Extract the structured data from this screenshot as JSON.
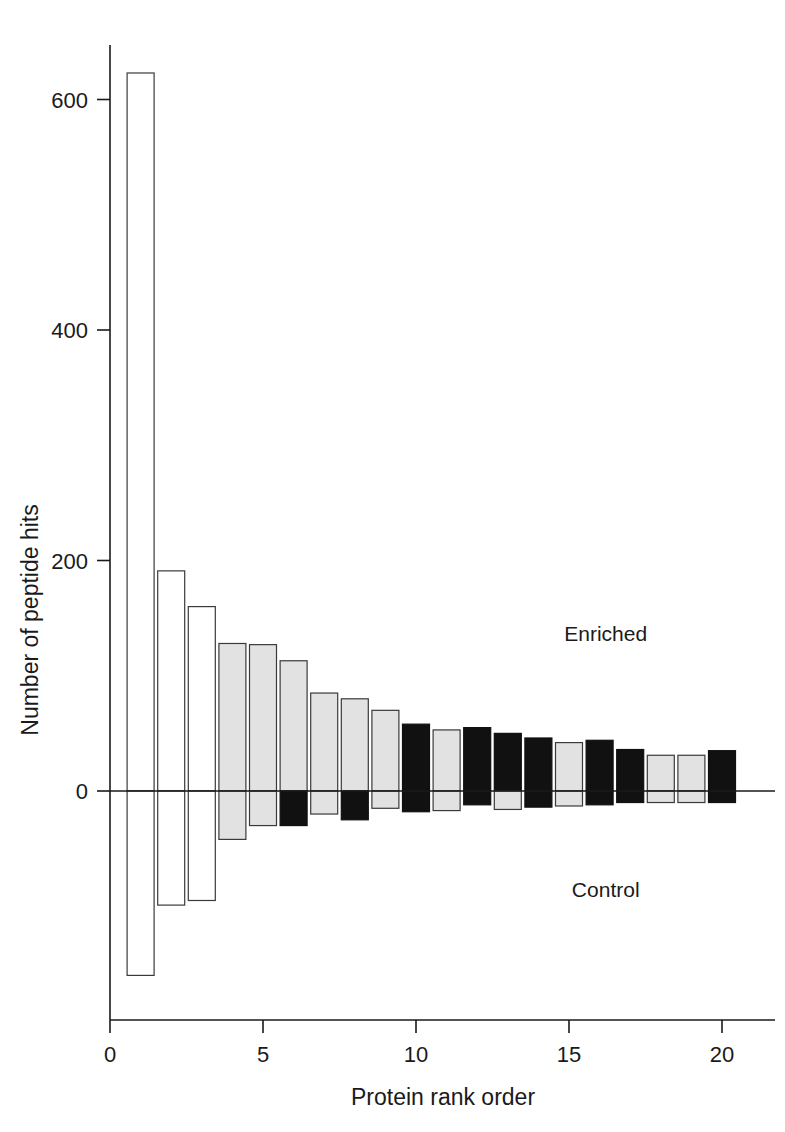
{
  "chart_data": {
    "type": "bar",
    "title": "",
    "xlabel": "Protein rank order",
    "ylabel": "Number of peptide hits",
    "xlim": [
      0,
      21
    ],
    "ylim": [
      -200,
      660
    ],
    "grid": false,
    "legend": "none",
    "annotations": [
      {
        "text": "Enriched",
        "x": 16.2,
        "y": 130
      },
      {
        "text": "Control",
        "x": 16.2,
        "y": -92
      }
    ],
    "xticks": [
      0,
      5,
      10,
      15,
      20
    ],
    "xtick_labels": [
      "0",
      "5",
      "10",
      "15",
      "20"
    ],
    "yticks": [
      0,
      200,
      400,
      600
    ],
    "ytick_labels": [
      "0",
      "200",
      "400",
      "600"
    ],
    "categories": [
      1,
      2,
      3,
      4,
      5,
      6,
      7,
      8,
      9,
      10,
      11,
      12,
      13,
      14,
      15,
      16,
      17,
      18,
      19,
      20
    ],
    "series": [
      {
        "name": "Enriched",
        "values": [
          623,
          191,
          160,
          128,
          127,
          113,
          85,
          80,
          70,
          58,
          53,
          55,
          50,
          46,
          42,
          44,
          36,
          31,
          31,
          35
        ]
      },
      {
        "name": "Control",
        "values": [
          -160,
          -99,
          -95,
          -42,
          -30,
          -30,
          -20,
          -25,
          -15,
          -18,
          -17,
          -12,
          -16,
          -14,
          -13,
          -12,
          -10,
          -10,
          -10,
          -10
        ]
      }
    ],
    "bar_fills": [
      "white",
      "white",
      "white",
      "gray",
      "gray",
      "mixed-gray-black",
      "gray",
      "mixed-gray-black",
      "gray",
      "black",
      "gray",
      "black",
      "black",
      "black",
      "gray",
      "black",
      "black",
      "gray",
      "gray",
      "black"
    ],
    "bar_styles": [
      {
        "rank": 1,
        "top_fill": "white",
        "bottom_fill": "white"
      },
      {
        "rank": 2,
        "top_fill": "white",
        "bottom_fill": "white"
      },
      {
        "rank": 3,
        "top_fill": "white",
        "bottom_fill": "white"
      },
      {
        "rank": 4,
        "top_fill": "gray",
        "bottom_fill": "gray"
      },
      {
        "rank": 5,
        "top_fill": "gray",
        "bottom_fill": "gray"
      },
      {
        "rank": 6,
        "top_fill": "gray",
        "bottom_fill": "black"
      },
      {
        "rank": 7,
        "top_fill": "gray",
        "bottom_fill": "gray"
      },
      {
        "rank": 8,
        "top_fill": "gray",
        "bottom_fill": "black"
      },
      {
        "rank": 9,
        "top_fill": "gray",
        "bottom_fill": "gray"
      },
      {
        "rank": 10,
        "top_fill": "black",
        "bottom_fill": "black"
      },
      {
        "rank": 11,
        "top_fill": "gray",
        "bottom_fill": "gray"
      },
      {
        "rank": 12,
        "top_fill": "black",
        "bottom_fill": "black"
      },
      {
        "rank": 13,
        "top_fill": "black",
        "bottom_fill": "gray"
      },
      {
        "rank": 14,
        "top_fill": "black",
        "bottom_fill": "black"
      },
      {
        "rank": 15,
        "top_fill": "gray",
        "bottom_fill": "gray"
      },
      {
        "rank": 16,
        "top_fill": "black",
        "bottom_fill": "black"
      },
      {
        "rank": 17,
        "top_fill": "black",
        "bottom_fill": "black"
      },
      {
        "rank": 18,
        "top_fill": "gray",
        "bottom_fill": "gray"
      },
      {
        "rank": 19,
        "top_fill": "gray",
        "bottom_fill": "gray"
      },
      {
        "rank": 20,
        "top_fill": "black",
        "bottom_fill": "black"
      }
    ]
  },
  "figure": {
    "background": "#ffffff",
    "axis_color": "#1a1a1a",
    "gray_fill": "#e2e2e2",
    "black_fill": "#111111",
    "white_fill": "#ffffff"
  }
}
